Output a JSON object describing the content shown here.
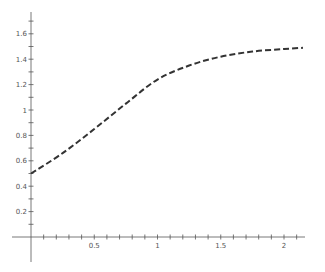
{
  "chart_data": {
    "type": "line",
    "title": "",
    "xlabel": "",
    "ylabel": "",
    "xlim": [
      0,
      2.15
    ],
    "ylim": [
      0,
      1.75
    ],
    "grid": false,
    "legend": null,
    "x_ticks": [
      0.5,
      1,
      1.5,
      2
    ],
    "x_tick_labels": [
      "0.5",
      "1",
      "1.5",
      "2"
    ],
    "x_minor_step": 0.1,
    "y_ticks": [
      0.2,
      0.4,
      0.6,
      0.8,
      1,
      1.2,
      1.4,
      1.6
    ],
    "y_tick_labels": [
      "0.2",
      "0.4",
      "0.6",
      "0.8",
      "1",
      "1.2",
      "1.4",
      "1.6"
    ],
    "y_minor_step": 0.1,
    "series": [
      {
        "name": "curve",
        "style": "dashed",
        "color": "#333333",
        "x": [
          0,
          0.25,
          0.5,
          0.75,
          1.0,
          1.25,
          1.5,
          1.75,
          2.0,
          2.15
        ],
        "y": [
          0.5,
          0.66,
          0.85,
          1.05,
          1.24,
          1.35,
          1.42,
          1.46,
          1.48,
          1.49
        ]
      }
    ]
  },
  "colors": {
    "axis": "#555555",
    "curve": "#333333",
    "background": "#ffffff"
  }
}
